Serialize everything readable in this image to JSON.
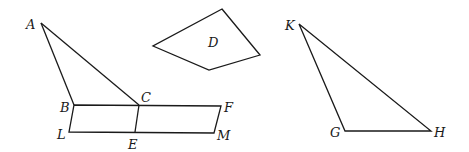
{
  "figures": {
    "triangle_abc": {
      "vertices": {
        "A": [
          41,
          23
        ],
        "B": [
          74,
          105
        ],
        "C": [
          139,
          105
        ]
      },
      "labels": {
        "A": "A",
        "B": "B",
        "C": "C"
      }
    },
    "parallelogram_bfml": {
      "vertices": {
        "B": [
          74,
          105
        ],
        "F": [
          221,
          106
        ],
        "M": [
          214,
          133
        ],
        "L": [
          69,
          132
        ]
      },
      "labels": {
        "F": "F",
        "M": "M",
        "L": "L"
      }
    },
    "segment_ce": {
      "vertices": {
        "C": [
          139,
          105
        ],
        "E": [
          135,
          132
        ]
      },
      "labels": {
        "E": "E"
      }
    },
    "quadrilateral_d": {
      "vertices": [
        [
          222,
          9
        ],
        [
          260,
          55
        ],
        [
          209,
          70
        ],
        [
          153,
          46
        ]
      ],
      "label": "D"
    },
    "triangle_kgh": {
      "vertices": {
        "K": [
          299,
          24
        ],
        "G": [
          345,
          131
        ],
        "H": [
          431,
          131
        ]
      },
      "labels": {
        "K": "K",
        "G": "G",
        "H": "H"
      }
    }
  },
  "colors": {
    "stroke": "#1a1a1a",
    "background": "#ffffff"
  }
}
